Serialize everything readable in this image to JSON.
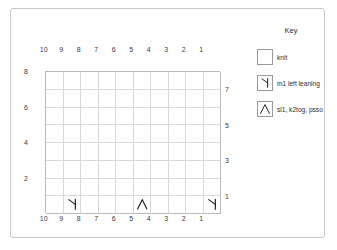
{
  "chart_data": {
    "type": "table",
    "columns": 10,
    "rows": 8,
    "column_labels_top": [
      "10",
      "9",
      "8",
      "7",
      "6",
      "5",
      "4",
      "3",
      "2",
      "1"
    ],
    "column_labels_bottom": [
      "10",
      "9",
      "8",
      "7",
      "6",
      "5",
      "4",
      "3",
      "2",
      "1"
    ],
    "row_labels_left": [
      "8",
      "6",
      "4",
      "2"
    ],
    "row_labels_right": [
      "7",
      "5",
      "3",
      "1"
    ],
    "grid": true,
    "default_cell": "knit",
    "symbols_placed": [
      {
        "row": 1,
        "column": 9,
        "symbol": "m1-left-leaning"
      },
      {
        "row": 1,
        "column": 5,
        "symbol": "sl1-k2tog-psso"
      },
      {
        "row": 1,
        "column": 1,
        "symbol": "m1-left-leaning"
      }
    ],
    "xlabel": "",
    "ylabel": ""
  },
  "key": {
    "title": "Key",
    "items": [
      {
        "symbol": "knit",
        "label": "knit"
      },
      {
        "symbol": "m1-left-leaning",
        "label": "m1 left leaning"
      },
      {
        "symbol": "sl1-k2tog-psso",
        "label": "sl1, k2tog, psso"
      }
    ]
  },
  "colors": {
    "frame_border": "#c8c8c8",
    "grid_line": "#d8d8d8",
    "grid_outer": "#b9b9b9",
    "text": "#2e2e2e",
    "symbol_stroke": "#1a1a1a"
  }
}
